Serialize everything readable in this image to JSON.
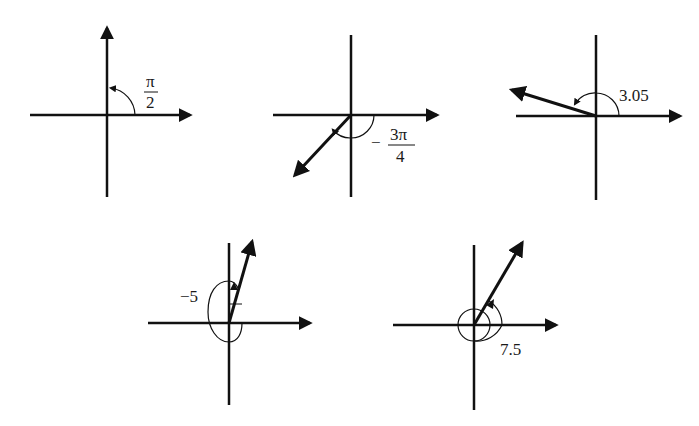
{
  "colors": {
    "ink": "#111111",
    "background": "#ffffff"
  },
  "diagrams": [
    {
      "id": "angle-pi-over-2",
      "label_numerator": "π",
      "label_denominator": "2",
      "label_prefix": "",
      "angle_radians": 1.5708,
      "direction": "counterclockwise"
    },
    {
      "id": "angle-neg-3pi-over-4",
      "label_numerator": "3π",
      "label_denominator": "4",
      "label_prefix": "−",
      "angle_radians": -2.3562,
      "direction": "clockwise"
    },
    {
      "id": "angle-3-05",
      "label": "3.05",
      "angle_radians": 3.05,
      "direction": "counterclockwise"
    },
    {
      "id": "angle-neg-5",
      "label": "−5",
      "angle_radians": -5,
      "direction": "clockwise"
    },
    {
      "id": "angle-7-5",
      "label": "7.5",
      "angle_radians": 7.5,
      "direction": "counterclockwise"
    }
  ]
}
